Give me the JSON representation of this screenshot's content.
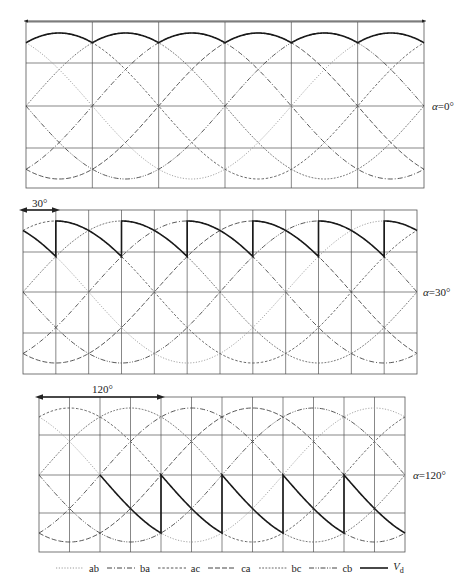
{
  "figure": {
    "panels": [
      {
        "id": "alpha-0",
        "label_prefix": "α",
        "label_value": "=0°",
        "alpha_deg": 0,
        "box": {
          "x0": 26,
          "x1": 424,
          "y_top": 22,
          "y_bottom": 188,
          "y_center": 106,
          "amplitude": 73
        },
        "grid": {
          "vertical_divisions": 6,
          "horizontal_lines_y": [
            63,
            106,
            148
          ]
        },
        "span_arrow": {
          "show": true,
          "from_deg": 0,
          "to_deg": 360,
          "y": 21,
          "text": ""
        },
        "label_pos": {
          "x": 432,
          "y": 100
        }
      },
      {
        "id": "alpha-30",
        "label_prefix": "α",
        "label_value": "=30°",
        "alpha_deg": 30,
        "box": {
          "x0": 23,
          "x1": 417,
          "y_top": 210,
          "y_bottom": 374,
          "y_center": 292,
          "amplitude": 71
        },
        "grid": {
          "vertical_divisions": 12,
          "horizontal_lines_y": [
            252,
            292,
            333
          ]
        },
        "span_arrow": {
          "show": true,
          "from_deg": 0,
          "to_deg": 30,
          "y": 210,
          "text": "30°",
          "text_x": 32,
          "text_y": 197
        },
        "label_pos": {
          "x": 423,
          "y": 286
        }
      },
      {
        "id": "alpha-120",
        "label_prefix": "α",
        "label_value": "=120°",
        "alpha_deg": 120,
        "box": {
          "x0": 39,
          "x1": 405,
          "y_top": 397,
          "y_bottom": 552,
          "y_center": 475,
          "amplitude": 67
        },
        "grid": {
          "vertical_divisions": 12,
          "horizontal_lines_y": [
            435,
            475,
            513
          ]
        },
        "span_arrow": {
          "show": true,
          "from_deg": 0,
          "to_deg": 120,
          "y": 397,
          "text": "120°",
          "text_x": 92,
          "text_y": 383
        },
        "label_pos": {
          "x": 413,
          "y": 469
        }
      }
    ],
    "waveforms": [
      {
        "name": "ab",
        "phase_deg": 60,
        "style": "dotted",
        "color": "#9a9a9a",
        "dash": "1.2 1.6"
      },
      {
        "name": "ba",
        "phase_deg": 240,
        "style": "dash-dot",
        "color": "#444444",
        "dash": "5 2 1 2"
      },
      {
        "name": "ac",
        "phase_deg": 0,
        "style": "short-dash",
        "color": "#555555",
        "dash": "2.5 1.8"
      },
      {
        "name": "ca",
        "phase_deg": 180,
        "style": "long-dash",
        "color": "#444444",
        "dash": "5 2"
      },
      {
        "name": "bc",
        "phase_deg": 300,
        "style": "fine-dash",
        "color": "#666666",
        "dash": "1.8 1.4"
      },
      {
        "name": "cb",
        "phase_deg": 120,
        "style": "dash-dot-dot",
        "color": "#444444",
        "dash": "5 1.5 1 1.5 1 1.5"
      }
    ],
    "output": {
      "name": "V_d",
      "color": "#1a1a1a",
      "width": 1.6
    }
  },
  "legend": {
    "items": [
      {
        "key": "ab",
        "label": "ab"
      },
      {
        "key": "ba",
        "label": "ba"
      },
      {
        "key": "ac",
        "label": "ac"
      },
      {
        "key": "ca",
        "label": "ca"
      },
      {
        "key": "bc",
        "label": "bc"
      },
      {
        "key": "cb",
        "label": "cb"
      }
    ],
    "output_label_main": "V",
    "output_label_sub": "d"
  },
  "colors": {
    "grid": "#555555",
    "background": "#ffffff",
    "text": "#222222"
  }
}
